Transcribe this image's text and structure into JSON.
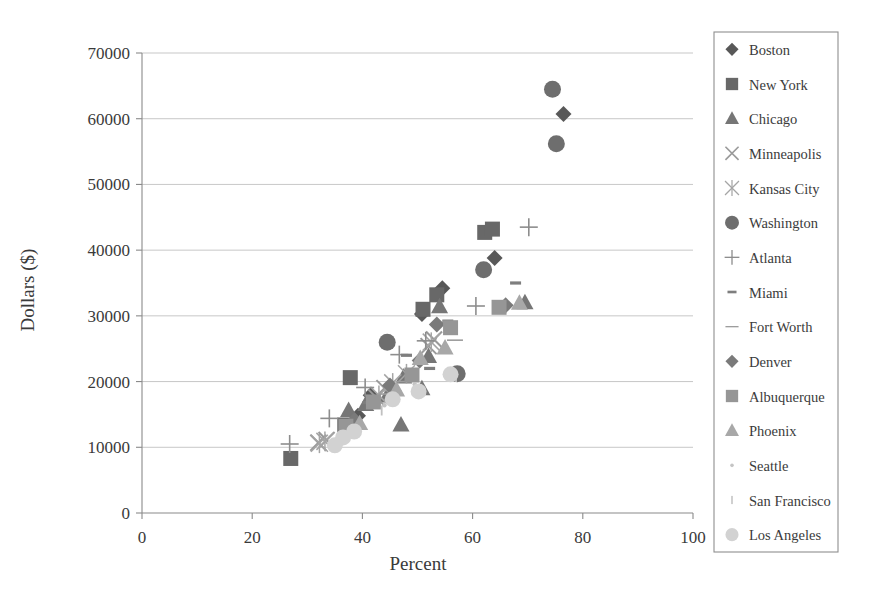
{
  "chart_data": {
    "type": "scatter",
    "title": "",
    "xlabel": "Percent",
    "ylabel": "Dollars ($)",
    "xlim": [
      0,
      100
    ],
    "ylim": [
      0,
      70000
    ],
    "xticks": [
      0,
      20,
      40,
      60,
      80,
      100
    ],
    "yticks": [
      0,
      10000,
      20000,
      30000,
      40000,
      50000,
      60000,
      70000
    ],
    "grid": "horizontal",
    "legend_position": "right-outside",
    "series": [
      {
        "name": "Boston",
        "marker": "diamond",
        "color": "#585858",
        "points": [
          {
            "x": 76.5,
            "y": 60700
          },
          {
            "x": 64.0,
            "y": 38800
          },
          {
            "x": 54.5,
            "y": 34200
          },
          {
            "x": 50.8,
            "y": 30300
          },
          {
            "x": 41.5,
            "y": 17900
          },
          {
            "x": 39.2,
            "y": 14800
          }
        ]
      },
      {
        "name": "New York",
        "marker": "square",
        "color": "#686868",
        "points": [
          {
            "x": 62.2,
            "y": 42700
          },
          {
            "x": 63.6,
            "y": 43200
          },
          {
            "x": 53.5,
            "y": 33200
          },
          {
            "x": 51.0,
            "y": 31000
          },
          {
            "x": 37.8,
            "y": 20600
          },
          {
            "x": 36.8,
            "y": 13400
          },
          {
            "x": 27.0,
            "y": 8300
          }
        ]
      },
      {
        "name": "Chicago",
        "marker": "triangle",
        "color": "#767676",
        "points": [
          {
            "x": 69.5,
            "y": 32000
          },
          {
            "x": 54.0,
            "y": 31400
          },
          {
            "x": 52.0,
            "y": 23800
          },
          {
            "x": 47.5,
            "y": 20700
          },
          {
            "x": 50.8,
            "y": 18900
          },
          {
            "x": 44.5,
            "y": 17800
          },
          {
            "x": 40.6,
            "y": 16500
          },
          {
            "x": 37.5,
            "y": 15600
          },
          {
            "x": 47.0,
            "y": 13400
          }
        ]
      },
      {
        "name": "Minneapolis",
        "marker": "x",
        "color": "#9a9a9a",
        "points": [
          {
            "x": 53.0,
            "y": 26400
          },
          {
            "x": 52.0,
            "y": 25400
          },
          {
            "x": 44.0,
            "y": 19000
          },
          {
            "x": 42.5,
            "y": 17600
          },
          {
            "x": 33.5,
            "y": 11100
          },
          {
            "x": 32.0,
            "y": 10700
          }
        ]
      },
      {
        "name": "Kansas City",
        "marker": "star",
        "color": "#a5a5a5",
        "points": [
          {
            "x": 52.5,
            "y": 26000
          },
          {
            "x": 48.0,
            "y": 21200
          },
          {
            "x": 45.5,
            "y": 19800
          },
          {
            "x": 43.0,
            "y": 17900
          },
          {
            "x": 33.2,
            "y": 10900
          },
          {
            "x": 32.2,
            "y": 10600
          }
        ]
      },
      {
        "name": "Washington",
        "marker": "circle",
        "color": "#6e6e6e",
        "points": [
          {
            "x": 74.5,
            "y": 64500
          },
          {
            "x": 75.2,
            "y": 56200
          },
          {
            "x": 62.0,
            "y": 37000
          },
          {
            "x": 57.2,
            "y": 21200
          },
          {
            "x": 44.5,
            "y": 26000
          }
        ]
      },
      {
        "name": "Atlanta",
        "marker": "plus",
        "color": "#8d8d8d",
        "points": [
          {
            "x": 70.2,
            "y": 43500
          },
          {
            "x": 60.6,
            "y": 31500
          },
          {
            "x": 51.5,
            "y": 26200
          },
          {
            "x": 46.7,
            "y": 24100
          },
          {
            "x": 40.5,
            "y": 19100
          },
          {
            "x": 34.0,
            "y": 14400
          },
          {
            "x": 26.8,
            "y": 10500
          }
        ]
      },
      {
        "name": "Miami",
        "marker": "dash-thick",
        "color": "#7e7e7e",
        "points": [
          {
            "x": 67.8,
            "y": 35000
          },
          {
            "x": 55.5,
            "y": 29200
          },
          {
            "x": 52.2,
            "y": 22000
          },
          {
            "x": 48.0,
            "y": 24000
          },
          {
            "x": 41.0,
            "y": 16800
          }
        ]
      },
      {
        "name": "Fort Worth",
        "marker": "dash-thin",
        "color": "#9d9d9d",
        "points": [
          {
            "x": 56.8,
            "y": 26300
          },
          {
            "x": 54.0,
            "y": 28900
          },
          {
            "x": 47.5,
            "y": 20000
          },
          {
            "x": 44.5,
            "y": 18100
          }
        ]
      },
      {
        "name": "Denver",
        "marker": "diamond",
        "color": "#7a7a7a",
        "points": [
          {
            "x": 66.0,
            "y": 31600
          },
          {
            "x": 53.5,
            "y": 28700
          },
          {
            "x": 50.4,
            "y": 23200
          },
          {
            "x": 45.0,
            "y": 19400
          },
          {
            "x": 38.6,
            "y": 14100
          }
        ]
      },
      {
        "name": "Albuquerque",
        "marker": "square",
        "color": "#969696",
        "points": [
          {
            "x": 64.8,
            "y": 31300
          },
          {
            "x": 56.0,
            "y": 28200
          },
          {
            "x": 49.0,
            "y": 21000
          },
          {
            "x": 42.0,
            "y": 16900
          },
          {
            "x": 37.0,
            "y": 13200
          }
        ]
      },
      {
        "name": "Phoenix",
        "marker": "triangle",
        "color": "#a8a8a8",
        "points": [
          {
            "x": 68.5,
            "y": 31900
          },
          {
            "x": 55.0,
            "y": 25100
          },
          {
            "x": 50.5,
            "y": 23500
          },
          {
            "x": 46.2,
            "y": 18700
          },
          {
            "x": 39.5,
            "y": 13600
          }
        ]
      },
      {
        "name": "Seattle",
        "marker": "dot-small",
        "color": "#c4c4c4",
        "points": [
          {
            "x": 55.5,
            "y": 21400
          },
          {
            "x": 49.5,
            "y": 19600
          },
          {
            "x": 44.0,
            "y": 16400
          },
          {
            "x": 38.0,
            "y": 12600
          }
        ]
      },
      {
        "name": "San Francisco",
        "marker": "bar-small",
        "color": "#c0c0c0",
        "points": [
          {
            "x": 57.0,
            "y": 20700
          },
          {
            "x": 50.0,
            "y": 18200
          },
          {
            "x": 43.5,
            "y": 15600
          },
          {
            "x": 37.6,
            "y": 12200
          }
        ]
      },
      {
        "name": "Los Angeles",
        "marker": "circle-light",
        "color": "#d2d2d2",
        "points": [
          {
            "x": 56.0,
            "y": 21100
          },
          {
            "x": 50.2,
            "y": 18500
          },
          {
            "x": 45.5,
            "y": 17300
          },
          {
            "x": 38.5,
            "y": 12400
          },
          {
            "x": 36.5,
            "y": 11500
          },
          {
            "x": 35.0,
            "y": 10300
          }
        ]
      }
    ]
  },
  "legend": {
    "entries": [
      {
        "label": "Boston"
      },
      {
        "label": "New York"
      },
      {
        "label": "Chicago"
      },
      {
        "label": "Minneapolis"
      },
      {
        "label": "Kansas City"
      },
      {
        "label": "Washington"
      },
      {
        "label": "Atlanta"
      },
      {
        "label": "Miami"
      },
      {
        "label": "Fort Worth"
      },
      {
        "label": "Denver"
      },
      {
        "label": "Albuquerque"
      },
      {
        "label": "Phoenix"
      },
      {
        "label": "Seattle"
      },
      {
        "label": "San Francisco"
      },
      {
        "label": "Los Angeles"
      }
    ]
  }
}
